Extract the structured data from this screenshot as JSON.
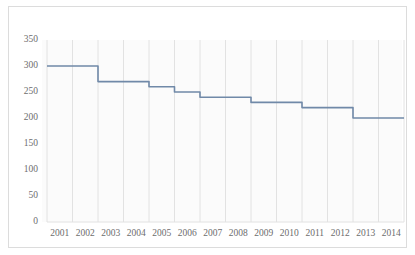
{
  "chart_data": {
    "type": "line",
    "title": "",
    "subtitle": "",
    "xlabel": "",
    "ylabel": "",
    "categories": [
      "2001",
      "2002",
      "2003",
      "2004",
      "2005",
      "2006",
      "2007",
      "2008",
      "2009",
      "2010",
      "2011",
      "2012",
      "2013",
      "2014"
    ],
    "values": [
      300,
      300,
      270,
      270,
      260,
      250,
      240,
      240,
      230,
      230,
      220,
      220,
      200,
      200
    ],
    "series": [
      {
        "name": "",
        "values": [
          300,
          300,
          270,
          270,
          260,
          250,
          240,
          240,
          230,
          230,
          220,
          220,
          200,
          200
        ]
      }
    ],
    "ylim": [
      0,
      350
    ],
    "yticks": [
      0,
      50,
      100,
      150,
      200,
      250,
      300,
      350
    ],
    "ytick_labels": [
      "0",
      "50",
      "100",
      "150",
      "200",
      "250",
      "300",
      "350"
    ],
    "xtick_labels": [
      "2001",
      "2002",
      "2003",
      "2004",
      "2005",
      "2006",
      "2007",
      "2008",
      "2009",
      "2010",
      "2011",
      "2012",
      "2013",
      "2014"
    ],
    "grid": {
      "vertical": true,
      "horizontal": false
    },
    "legend": {
      "visible": false,
      "position": "none",
      "entries": []
    },
    "step_style": "category-plateau",
    "annotations": []
  },
  "style": {
    "line_color": "#7089a8",
    "grid_color": "#e2e2e2",
    "plot_background": "#fbfbfb",
    "frame_border_color": "#dcdcdc",
    "tick_label_color": "#6d6d6d",
    "page_background": "#ffffff"
  },
  "axis": {
    "y_axis_name": "value-axis",
    "x_axis_name": "year-axis"
  }
}
